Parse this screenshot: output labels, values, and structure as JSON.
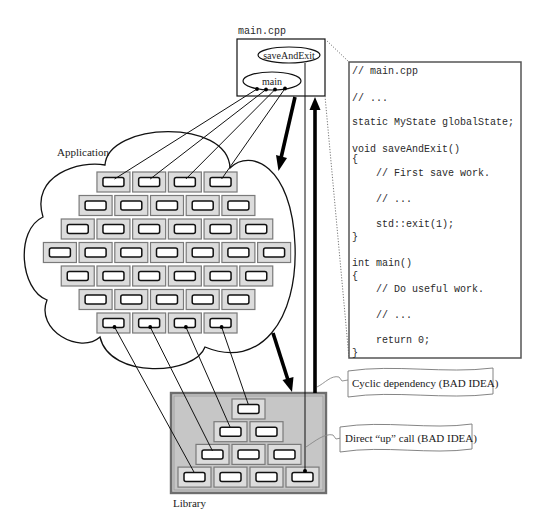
{
  "main_file": {
    "label": "main.cpp",
    "functions": {
      "save_and_exit": "saveAndExit",
      "main": "main"
    }
  },
  "code_panel": {
    "lines": [
      "// main.cpp",
      "// ...",
      "static MyState globalState;",
      "void saveAndExit()",
      "{",
      "    // First save work.",
      "    // ...",
      "    std::exit(1);",
      "}",
      "int main()",
      "{",
      "    // Do useful work.",
      "    // ...",
      "    return 0;",
      "}"
    ]
  },
  "application": {
    "label": "Application",
    "brick_rows": [
      4,
      5,
      6,
      7,
      6,
      5,
      4
    ]
  },
  "library": {
    "label": "Library",
    "brick_rows": [
      1,
      2,
      3,
      4
    ]
  },
  "callouts": {
    "cyclic_dependency": "Cyclic dependency (BAD IDEA)",
    "direct_up_call": "Direct “up” call (BAD IDEA)"
  },
  "colors": {
    "brick_fill": "#dcdcdc",
    "library_fill": "#c6c6c6",
    "outline": "#111111"
  }
}
